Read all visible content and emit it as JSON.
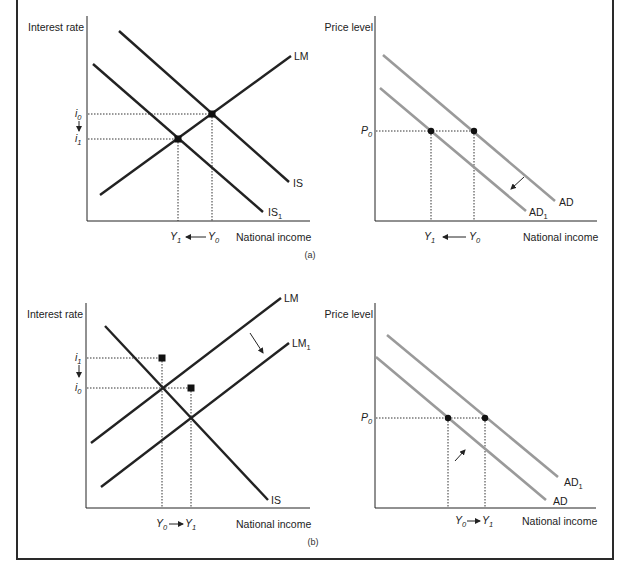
{
  "figure": {
    "panels": [
      {
        "id": "a",
        "caption": "(a)",
        "left_chart": {
          "y_axis_label": "Interest rate",
          "x_axis_label": "National income",
          "curves": [
            {
              "name": "LM",
              "label": "LM",
              "color": "#222222"
            },
            {
              "name": "IS",
              "label": "IS",
              "color": "#222222"
            },
            {
              "name": "IS1",
              "label": "IS",
              "sub": "1",
              "color": "#222222"
            }
          ],
          "y_ticks": [
            {
              "base": "i",
              "sub": "0"
            },
            {
              "base": "i",
              "sub": "1"
            }
          ],
          "x_ticks": [
            {
              "base": "Y",
              "sub": "1"
            },
            {
              "base": "Y",
              "sub": "0"
            }
          ],
          "shift": "IS shifts left to IS1; interest rate falls i0 → i1; income falls Y0 → Y1"
        },
        "right_chart": {
          "y_axis_label": "Price level",
          "x_axis_label": "National income",
          "curves": [
            {
              "name": "AD",
              "label": "AD",
              "color": "#9a9a9a"
            },
            {
              "name": "AD1",
              "label": "AD",
              "sub": "1",
              "color": "#9a9a9a"
            }
          ],
          "y_ticks": [
            {
              "base": "P",
              "sub": "0"
            }
          ],
          "x_ticks": [
            {
              "base": "Y",
              "sub": "1"
            },
            {
              "base": "Y",
              "sub": "0"
            }
          ],
          "shift": "AD shifts left to AD1"
        }
      },
      {
        "id": "b",
        "caption": "(b)",
        "left_chart": {
          "y_axis_label": "Interest rate",
          "x_axis_label": "National income",
          "curves": [
            {
              "name": "LM",
              "label": "LM",
              "color": "#222222"
            },
            {
              "name": "LM1",
              "label": "LM",
              "sub": "1",
              "color": "#222222"
            },
            {
              "name": "IS",
              "label": "IS",
              "color": "#222222"
            }
          ],
          "y_ticks": [
            {
              "base": "i",
              "sub": "1"
            },
            {
              "base": "i",
              "sub": "0"
            }
          ],
          "x_ticks": [
            {
              "base": "Y",
              "sub": "0"
            },
            {
              "base": "Y",
              "sub": "1"
            }
          ],
          "shift": "LM shifts right to LM1; interest rate falls i1 → i0; income rises Y0 → Y1"
        },
        "right_chart": {
          "y_axis_label": "Price level",
          "x_axis_label": "National income",
          "curves": [
            {
              "name": "AD1",
              "label": "AD",
              "sub": "1",
              "color": "#9a9a9a"
            },
            {
              "name": "AD",
              "label": "AD",
              "color": "#9a9a9a"
            }
          ],
          "y_ticks": [
            {
              "base": "P",
              "sub": "0"
            }
          ],
          "x_ticks": [
            {
              "base": "Y",
              "sub": "0"
            },
            {
              "base": "Y",
              "sub": "1"
            }
          ],
          "shift": "AD shifts right to AD1"
        }
      }
    ],
    "colors": {
      "ink": "#222222",
      "ad_gray": "#9a9a9a",
      "frame": "#2a2a2a"
    }
  },
  "text": {
    "a_left_ylabel": "Interest rate",
    "a_left_xlabel": "National income",
    "a_right_ylabel": "Price level",
    "a_right_xlabel": "National income",
    "b_left_ylabel": "Interest rate",
    "b_left_xlabel": "National income",
    "b_right_ylabel": "Price level",
    "b_right_xlabel": "National income",
    "caption_a": "(a)",
    "caption_b": "(b)",
    "lm": "LM",
    "is": "IS",
    "ad": "AD",
    "one": "1",
    "zero": "0",
    "i": "i",
    "y": "Y",
    "p": "P"
  }
}
